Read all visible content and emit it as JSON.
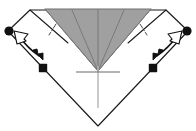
{
  "figure": {
    "type": "origami-instruction-diagram",
    "canvas": {
      "width": 196,
      "height": 131,
      "background": "#ffffff"
    }
  },
  "colors": {
    "paper_front": "#ffffff",
    "paper_shaded": "#a0a0a0",
    "shaded_edge": "#6f6f6f",
    "outline": "#1a1a1a",
    "crease_solid": "#808080",
    "crease_light": "#b8b8b8",
    "marker": "#111111",
    "arrow": "#111111"
  },
  "shapes": {
    "outer_outline": {
      "name": "outer-paper-outline",
      "label": "Outer folded paper silhouette",
      "points": "30,10 8,31 43,68 98,126 153,68 188,31 166,10"
    },
    "shaded_triangle": {
      "name": "shaded-triangle",
      "label": "Shaded back-side triangular flap",
      "points": "45,9 151,9 98,71"
    },
    "left_flap": {
      "name": "left-white-flap",
      "label": "Left white flap panel",
      "points": "30,10 8,31 43,68 68,43"
    },
    "right_flap": {
      "name": "right-white-flap",
      "label": "Right white flap panel",
      "points": "166,10 188,31 153,68 128,43"
    }
  },
  "creases": {
    "shaded_internal": [
      {
        "name": "crease-center-vertical",
        "label": "Center vertical crease",
        "d": "M98,10 L98,71"
      },
      {
        "name": "crease-left-diagonal",
        "label": "Left diagonal crease",
        "d": "M45,9 L98,71"
      },
      {
        "name": "crease-right-diagonal",
        "label": "Right diagonal crease",
        "d": "M151,9 L98,71"
      },
      {
        "name": "crease-left-inner",
        "label": "Left inner crease",
        "d": "M72,10 L98,71"
      },
      {
        "name": "crease-right-inner",
        "label": "Right inner crease",
        "d": "M124,10 L98,71"
      }
    ],
    "dash_dot_marks": [
      {
        "name": "crease-mark-left",
        "label": "Left short dash-dot crease mark",
        "d": "M56,24 L49,35"
      },
      {
        "name": "crease-mark-right",
        "label": "Right short dash-dot crease mark",
        "d": "M140,24 L147,35"
      }
    ],
    "reference_line": {
      "name": "center-reference-line",
      "label": "Vertical reference line below apex",
      "d": "M98,66 L98,108"
    },
    "reference_tick": {
      "name": "center-reference-tick",
      "label": "Horizontal tick mark at apex",
      "d": "M76,72 L120,72"
    },
    "flap_edge_left": {
      "name": "left-flap-edge",
      "label": "Left flap folded edge",
      "d": "M30,10 L68,43"
    },
    "flap_edge_right": {
      "name": "right-flap-edge",
      "label": "Right flap folded edge",
      "d": "M166,10 L128,43"
    }
  },
  "markers": [
    {
      "name": "marker-dot-top-left",
      "label": "Reference point top-left",
      "shape": "circle",
      "cx": 9,
      "cy": 31,
      "r": 4.6
    },
    {
      "name": "marker-dot-top-right",
      "label": "Reference point top-right",
      "shape": "circle",
      "cx": 187,
      "cy": 31,
      "r": 4.6
    },
    {
      "name": "marker-dot-bottom-left",
      "label": "Reference point lower-left",
      "shape": "square",
      "cx": 43,
      "cy": 68,
      "r": 4.2
    },
    {
      "name": "marker-dot-bottom-right",
      "label": "Reference point lower-right",
      "shape": "square",
      "cx": 153,
      "cy": 68,
      "r": 4.2
    }
  ],
  "arrows": [
    {
      "name": "fold-arrow-left",
      "label": "Left fold-and-unfold arrow",
      "shaft": "M20,37 C26,46 32,51 39,56",
      "head_solid": {
        "points": "39,56 32,52 35,48",
        "rotate": 0
      },
      "head_hollow": {
        "points": "16,33 27,35 23,43"
      },
      "head_solid_tip": [
        41,
        58
      ],
      "head_hollow_tip": [
        15,
        32
      ],
      "style_solid": "filled",
      "style_hollow": "outline"
    },
    {
      "name": "fold-arrow-right",
      "label": "Right fold-and-unfold arrow",
      "shaft": "M176,37 C170,46 164,51 157,56",
      "head_solid": {
        "points": "157,56 164,52 161,48"
      },
      "head_hollow": {
        "points": "180,33 169,35 173,43"
      },
      "head_solid_tip": [
        155,
        58
      ],
      "head_hollow_tip": [
        181,
        32
      ],
      "style_solid": "filled",
      "style_hollow": "outline"
    }
  ],
  "accessibility": {
    "description": "An origami diagram showing a downward-pointing folded paper. The upper middle region is a shaded gray triangle with radiating crease lines meeting at a lower apex. Two white side flaps carry curved double-headed arrows indicating fold and unfold. Four reference dots mark flap corners. A light vertical reference line with a horizontal tick descends from the apex."
  }
}
